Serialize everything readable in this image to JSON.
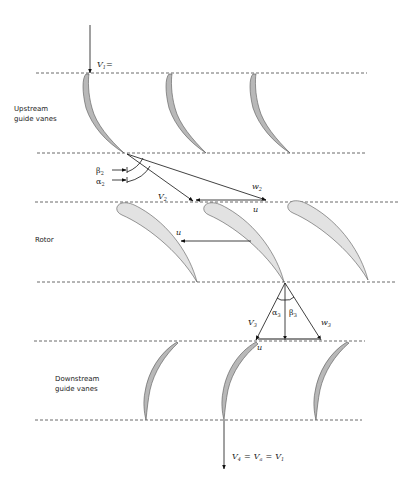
{
  "diagram": {
    "type": "axial turbomachine stage velocity diagram",
    "colors": {
      "line": "#222222",
      "dash": "#444444",
      "vane_fill": "#b8b8b8",
      "rotor_fill": "#e2e2e2",
      "blade_stroke": "#555555"
    },
    "stages": [
      {
        "id": "upstream",
        "label_line1": "Upstream",
        "label_line2": "guide vanes"
      },
      {
        "id": "rotor",
        "label_line1": "Rotor"
      },
      {
        "id": "downstream",
        "label_line1": "Downstream",
        "label_line2": "guide vanes"
      }
    ],
    "labels": {
      "v1": "V",
      "v1_sub": "1",
      "v1_suffix": "=",
      "beta2": "β",
      "beta2_sub": "2",
      "alpha2": "α",
      "alpha2_sub": "2",
      "v2": "V",
      "v2_sub": "2",
      "w2": "w",
      "w2_sub": "2",
      "u_inlet": "u",
      "u_rotor": "u",
      "alpha3": "α",
      "alpha3_sub": "3",
      "beta3": "β",
      "beta3_sub": "3",
      "v3": "V",
      "v3_sub": "3",
      "w3": "w",
      "w3_sub": "3",
      "u_outlet": "u",
      "v4": "V",
      "v4_sub": "4",
      "va": "V",
      "va_sub": "a",
      "v1b": "V",
      "v1b_sub": "1",
      "eq": "="
    }
  }
}
